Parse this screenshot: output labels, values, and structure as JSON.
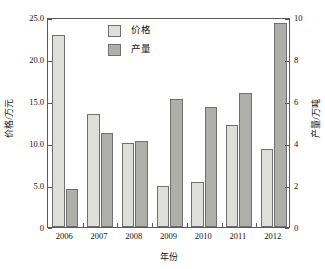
{
  "chart_data": {
    "type": "bar",
    "title": "",
    "subtitle": "",
    "xlabel": "年份",
    "ylabel": "价格/万元",
    "ylabel_right": "产量/万吨",
    "categories": [
      "2006",
      "2007",
      "2008",
      "2009",
      "2010",
      "2011",
      "2012"
    ],
    "series": [
      {
        "name": "价格",
        "axis": "left",
        "unit": "万元",
        "color": "#dededa",
        "values": [
          22.9,
          13.4,
          10.0,
          4.9,
          5.4,
          12.2,
          9.3
        ]
      },
      {
        "name": "产量",
        "axis": "right",
        "unit": "万吨",
        "color": "#aeaeaa",
        "values": [
          1.8,
          4.5,
          4.1,
          6.1,
          5.7,
          6.4,
          9.7
        ]
      }
    ],
    "ylim": [
      0,
      25
    ],
    "ylim_right": [
      0,
      10
    ],
    "yticks": [
      "0",
      "5.0",
      "10.0",
      "15.0",
      "20.0",
      "25.0"
    ],
    "ytick_values": [
      0,
      5,
      10,
      15,
      20,
      25
    ],
    "yticks_right": [
      "0",
      "2",
      "4",
      "6",
      "8",
      "10"
    ],
    "ytick_values_right": [
      0,
      2,
      4,
      6,
      8,
      10
    ],
    "grid": false,
    "legend_position": "top-center",
    "legend": [
      "价格",
      "产量"
    ],
    "frame_color": "#5a5a5a",
    "bar_edge_color": "#6f6f6f",
    "background": "#ffffff"
  }
}
